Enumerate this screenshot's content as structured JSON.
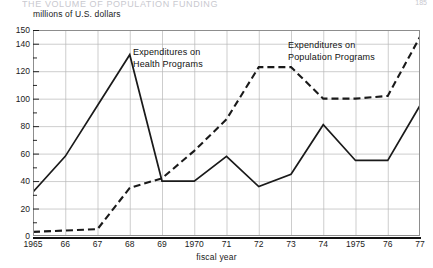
{
  "page": {
    "cut_title": "THE VOLUME OF POPULATION FUNDING",
    "folio": "185"
  },
  "chart_data": {
    "type": "line",
    "title": "",
    "ylabel": "millions of U.S. dollars",
    "xlabel": "fiscal year",
    "x": [
      1965,
      1966,
      1967,
      1968,
      1969,
      1970,
      1971,
      1972,
      1973,
      1974,
      1975,
      1976,
      1977
    ],
    "xtick_labels": [
      "1965",
      "66",
      "67",
      "68",
      "69",
      "1970",
      "71",
      "72",
      "73",
      "74",
      "1975",
      "76",
      "77"
    ],
    "ytick_labels": [
      "0",
      "20",
      "40",
      "60",
      "80",
      "100",
      "120",
      "140",
      "150"
    ],
    "yticks": [
      0,
      20,
      40,
      60,
      80,
      100,
      120,
      140,
      150
    ],
    "minor_yticks": [
      10,
      30,
      50,
      70,
      90,
      110,
      130
    ],
    "ylim": [
      0,
      150
    ],
    "grid": "both",
    "legend_position": "inline-annotations",
    "series": [
      {
        "name": "Expenditures on Health Programs",
        "style": "solid",
        "values": [
          32,
          58,
          95,
          132,
          40,
          40,
          58,
          36,
          45,
          81,
          55,
          55,
          95
        ]
      },
      {
        "name": "Expenditures on Population Programs",
        "style": "dashed",
        "values": [
          3,
          4,
          5,
          35,
          42,
          62,
          85,
          123,
          123,
          100,
          100,
          102,
          145
        ]
      }
    ],
    "annotations": [
      {
        "text": "Expenditures on Health Programs",
        "series": "Expenditures on Health Programs"
      },
      {
        "text": "Expenditures on Population Programs",
        "series": "Expenditures on Population Programs"
      }
    ],
    "colors": {
      "line": "#1a1a1a",
      "grid": "#b8b8b8",
      "axis": "#111111",
      "background": "#ffffff"
    }
  }
}
